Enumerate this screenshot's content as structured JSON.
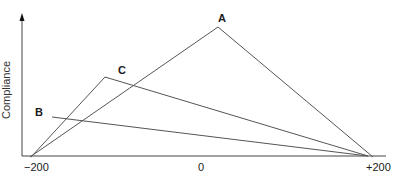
{
  "diagram": {
    "y_axis_label": "Compliance",
    "x_ticks": [
      {
        "label": "−200",
        "value": -200
      },
      {
        "label": "0",
        "value": 0
      },
      {
        "label": "+200",
        "value": 200
      }
    ],
    "curves": [
      {
        "label": "A",
        "description": "rises from -200 to a high peak just right of 0, then falls to +200"
      },
      {
        "label": "B",
        "description": "starts mid-low on left and declines gradually to +200"
      },
      {
        "label": "C",
        "description": "rises from -200 to a moderate peak left of 0, then declines to +200"
      }
    ],
    "colors": {
      "line": "#555555",
      "axis": "#444444",
      "text": "#1a1a1a"
    }
  }
}
